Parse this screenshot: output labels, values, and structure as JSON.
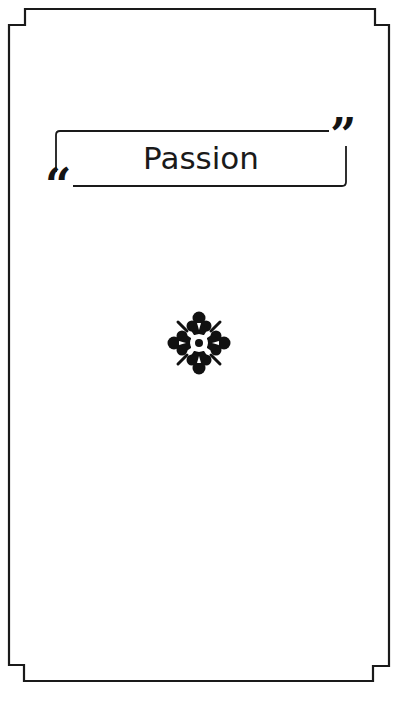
{
  "card": {
    "title": "Passion",
    "open_quote": "“",
    "close_quote": "”",
    "ornament_icon": "floral-ornament",
    "colors": {
      "background": "#ffffff",
      "stroke": "#1a1a1a"
    }
  }
}
